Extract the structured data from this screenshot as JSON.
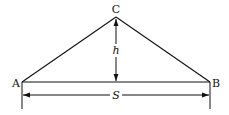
{
  "diagram": {
    "type": "triangle-dimension",
    "stroke_color": "#111111",
    "background": "#ffffff",
    "vertices": {
      "A": {
        "label": "A",
        "x": 22,
        "y": 82
      },
      "B": {
        "label": "B",
        "x": 210,
        "y": 82
      },
      "C": {
        "label": "C",
        "x": 116,
        "y": 17
      }
    },
    "height": {
      "label": "h"
    },
    "span": {
      "label": "S"
    }
  }
}
